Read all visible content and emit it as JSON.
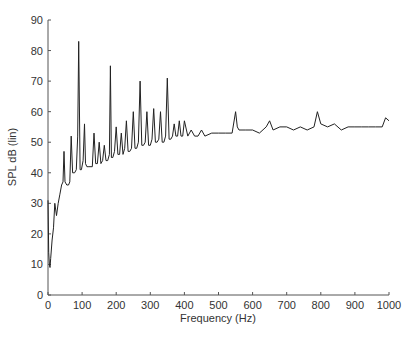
{
  "chart_data": {
    "type": "line",
    "title": "",
    "xlabel": "Frequency (Hz)",
    "ylabel": "SPL dB (lin)",
    "xlim": [
      0,
      1000
    ],
    "ylim": [
      0,
      90
    ],
    "xticks": [
      "0",
      "100",
      "200",
      "300",
      "400",
      "500",
      "600",
      "700",
      "800",
      "900",
      "1000"
    ],
    "yticks": [
      "0",
      "10",
      "20",
      "30",
      "40",
      "50",
      "60",
      "70",
      "80",
      "90"
    ],
    "grid": false,
    "legend": null,
    "x": [
      0,
      2,
      4,
      6,
      8,
      12,
      16,
      20,
      25,
      30,
      35,
      40,
      44,
      47,
      50,
      55,
      60,
      64,
      68,
      72,
      78,
      83,
      87,
      90,
      94,
      98,
      103,
      107,
      110,
      114,
      120,
      130,
      135,
      140,
      145,
      150,
      155,
      160,
      165,
      170,
      175,
      180,
      183,
      186,
      190,
      195,
      200,
      205,
      210,
      215,
      220,
      225,
      230,
      235,
      240,
      245,
      250,
      255,
      260,
      265,
      270,
      275,
      280,
      285,
      290,
      295,
      300,
      305,
      310,
      315,
      320,
      325,
      330,
      335,
      340,
      345,
      350,
      355,
      360,
      365,
      370,
      375,
      380,
      385,
      390,
      395,
      400,
      410,
      420,
      430,
      440,
      450,
      460,
      480,
      500,
      520,
      540,
      550,
      555,
      560,
      580,
      600,
      620,
      640,
      650,
      660,
      680,
      700,
      720,
      740,
      760,
      780,
      790,
      800,
      820,
      840,
      860,
      880,
      900,
      920,
      940,
      960,
      980,
      990,
      1000
    ],
    "values": [
      31,
      14,
      10,
      9,
      12,
      18,
      22,
      30,
      26,
      30,
      33,
      36,
      37,
      47,
      37,
      36,
      36,
      37,
      52,
      40,
      40,
      41,
      52,
      83,
      41,
      41,
      44,
      56,
      43,
      42,
      42,
      42,
      53,
      43,
      43,
      50,
      43,
      44,
      49,
      44,
      44,
      46,
      75,
      45,
      45,
      47,
      55,
      46,
      46,
      53,
      46,
      48,
      57,
      47,
      47,
      48,
      60,
      48,
      48,
      50,
      70,
      49,
      49,
      50,
      60,
      49,
      49,
      51,
      61,
      50,
      50,
      51,
      60,
      50,
      50,
      52,
      71,
      51,
      51,
      52,
      56,
      52,
      52,
      57,
      52,
      52,
      57,
      52,
      54,
      52,
      52,
      54,
      52,
      53,
      53,
      53,
      53,
      60,
      55,
      54,
      54,
      54,
      53,
      55,
      57,
      54,
      55,
      55,
      54,
      55,
      54,
      55,
      60,
      56,
      55,
      56,
      54,
      55,
      55,
      55,
      55,
      55,
      55,
      58,
      57
    ]
  }
}
